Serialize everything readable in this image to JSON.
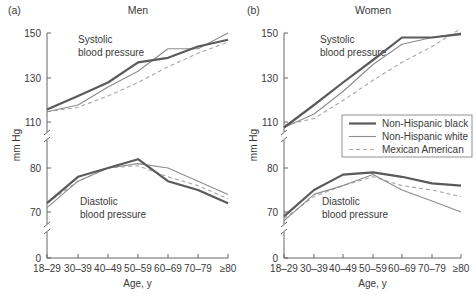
{
  "chart_data": [
    {
      "type": "line",
      "panel_label": "(a)",
      "title": "Men",
      "xlabel": "Age, y",
      "ylabel": "mm Hg",
      "categories": [
        "18–29",
        "30–39",
        "40–49",
        "50–59",
        "60–69",
        "70–79",
        "≥80"
      ],
      "y_ticks": [
        "150",
        "130",
        "110",
        "80",
        "70",
        "0"
      ],
      "broken_axis": true,
      "subplots": [
        {
          "name": "Systolic blood pressure",
          "ylim": [
            105,
            152
          ],
          "series": [
            {
              "name": "Non-Hispanic black",
              "values": [
                116,
                122,
                128,
                137,
                139,
                144,
                147
              ]
            },
            {
              "name": "Non-Hispanic white",
              "values": [
                115,
                118,
                126,
                133,
                143,
                143,
                150
              ]
            },
            {
              "name": "Mexican American",
              "values": [
                115,
                117,
                122,
                128,
                135,
                141,
                146
              ]
            }
          ]
        },
        {
          "name": "Diastolic blood pressure",
          "ylim": [
            65,
            84
          ],
          "series": [
            {
              "name": "Non-Hispanic black",
              "values": [
                72,
                78,
                80,
                82,
                77,
                75,
                72
              ]
            },
            {
              "name": "Non-Hispanic white",
              "values": [
                71,
                77,
                80,
                81,
                80,
                77,
                74
              ]
            },
            {
              "name": "Mexican American",
              "values": [
                72,
                77,
                80,
                80.5,
                78,
                76,
                73
              ]
            }
          ]
        }
      ]
    },
    {
      "type": "line",
      "panel_label": "(b)",
      "title": "Women",
      "xlabel": "Age, y",
      "ylabel": "mm Hg",
      "categories": [
        "18–29",
        "30–39",
        "40–49",
        "50–59",
        "60–69",
        "70–79",
        "≥80"
      ],
      "y_ticks": [
        "150",
        "130",
        "110",
        "80",
        "70",
        "0"
      ],
      "broken_axis": true,
      "legend": {
        "position": "right, between subplots",
        "entries": [
          "Non-Hispanic black",
          "Non-Hispanic white",
          "Mexican American"
        ]
      },
      "subplots": [
        {
          "name": "Systolic blood pressure",
          "ylim": [
            105,
            152
          ],
          "series": [
            {
              "name": "Non-Hispanic black",
              "values": [
                108,
                118,
                128,
                138,
                148,
                148,
                149.5
              ]
            },
            {
              "name": "Non-Hispanic white",
              "values": [
                108,
                114,
                124,
                136,
                145,
                148,
                150
              ]
            },
            {
              "name": "Mexican American",
              "values": [
                109,
                112,
                120,
                129,
                137,
                144,
                152
              ]
            }
          ]
        },
        {
          "name": "Diastolic blood pressure",
          "ylim": [
            65,
            84
          ],
          "series": [
            {
              "name": "Non-Hispanic black",
              "values": [
                69,
                75,
                78.5,
                79,
                78,
                76.5,
                76
              ]
            },
            {
              "name": "Non-Hispanic white",
              "values": [
                68,
                74,
                76,
                78.5,
                75,
                72.5,
                70
              ]
            },
            {
              "name": "Mexican American",
              "values": [
                68.5,
                73.5,
                76,
                78,
                76,
                75,
                73.5
              ]
            }
          ]
        }
      ]
    }
  ],
  "styles": {
    "black_color": "#5a5a5a",
    "white_color": "#8c8c8c",
    "mexican_color": "#a8a8a8",
    "axis_color": "#555555"
  },
  "labels": {
    "men_panel": "(a)",
    "men_title": "Men",
    "women_panel": "(b)",
    "women_title": "Women",
    "systolic_line1": "Systolic",
    "systolic_line2": "blood pressure",
    "diastolic_line1": "Diastolic",
    "diastolic_line2": "blood pressure",
    "ylabel": "mm Hg",
    "xlabel": "Age, y",
    "legend_black": "Non-Hispanic black",
    "legend_white": "Non-Hispanic white",
    "legend_mexican": "Mexican American"
  }
}
